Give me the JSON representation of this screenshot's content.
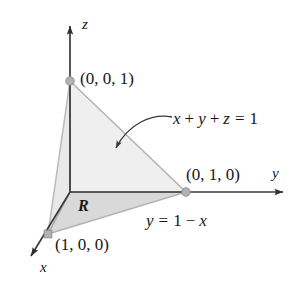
{
  "figure": {
    "background_color": "#ffffff",
    "width": 304,
    "height": 283
  },
  "axes": {
    "origin": {
      "x": 70,
      "y": 192
    },
    "items": [
      {
        "name": "z-axis",
        "label": "z",
        "direction": "up",
        "tip": {
          "x": 70,
          "y": 18
        }
      },
      {
        "name": "y-axis",
        "label": "y",
        "direction": "right",
        "tip": {
          "x": 291,
          "y": 192
        }
      },
      {
        "name": "x-axis",
        "label": "x",
        "direction": "down-left",
        "tip": {
          "x": 24,
          "y": 265
        }
      }
    ],
    "axis_color": "#3a3a3a"
  },
  "vertices": [
    {
      "name": "z-intercept",
      "label": "(0, 0, 1)",
      "x": 70,
      "y": 81
    },
    {
      "name": "y-intercept",
      "label": "(0, 1, 0)",
      "x": 186,
      "y": 192
    },
    {
      "name": "x-intercept",
      "label": "(1, 0, 0)",
      "x": 48,
      "y": 234
    }
  ],
  "annotations": {
    "plane_equation": "x + y + z = 1",
    "plane_equation_parts": {
      "x": "x",
      "plus1": "+",
      "y": "y",
      "plus2": "+",
      "z": "z",
      "equals": "=",
      "one": "1"
    },
    "line_equation": "y = 1 − x",
    "region_label": "R",
    "leader_arrow": {
      "name": "leader-arrow",
      "from": {
        "x": 172,
        "y": 118
      },
      "to": {
        "x": 113,
        "y": 152
      }
    }
  },
  "colors": {
    "plane_fill": "#efefef",
    "plane_fill_left": "#e8e8e8",
    "region_fill": "#d9d9d9",
    "edge": "#a8a8a8",
    "dot": "#b0b0b0",
    "dot_stroke": "#8d8d8d",
    "text": "#161616",
    "axis": "#3a3a3a"
  }
}
